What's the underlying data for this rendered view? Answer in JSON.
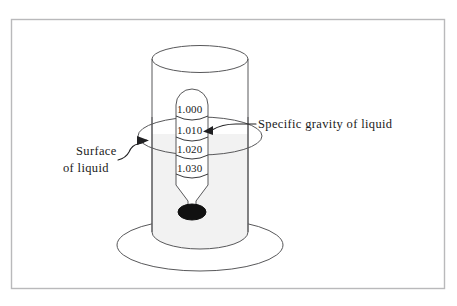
{
  "figure": {
    "background_color": "#ffffff",
    "frame": {
      "name": "figure-border",
      "color": "#b9b9bb"
    }
  },
  "annotations": {
    "right_label": {
      "text": "Specific gravity of liquid",
      "points_to": "hydrometer-scale-reading"
    },
    "left_label": {
      "line1": "Surface",
      "line2": "of liquid",
      "points_to": "liquid-surface-ellipse"
    }
  },
  "hydrometer": {
    "name": "hydrometer",
    "scale_readings": [
      "1.000",
      "1.010",
      "1.020",
      "1.030"
    ],
    "bulb_color": "#111111",
    "stem_color": "#ffffff"
  },
  "vessel": {
    "name": "cylinder-beaker",
    "liquid_fill_color": "#f2f2f2",
    "surface_fill_color": "#ededed",
    "outline_color": "#58585a"
  }
}
